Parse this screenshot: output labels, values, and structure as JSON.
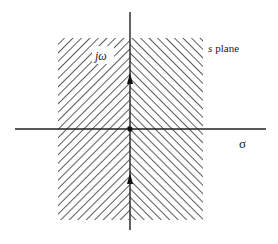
{
  "diagram": {
    "labels": {
      "imag_axis": "jω",
      "real_axis": "σ",
      "plane": "s plane"
    },
    "plane_var": "s",
    "plane_word": "plane",
    "region": {
      "description": "Entire strip hatched; left half with forward-slash hatching, right half with back-slash hatching (chevron pattern about the jω axis)",
      "x_range_px": [
        58,
        203
      ],
      "y_range_px": [
        38,
        220
      ]
    },
    "axes": {
      "vertical_x_px": 130,
      "vertical_y_range_px": [
        12,
        230
      ],
      "horizontal_y_px": 129,
      "horizontal_x_range_px": [
        15,
        266
      ]
    },
    "markers": [
      {
        "type": "origin-dot",
        "x": 130,
        "y": 129
      },
      {
        "type": "up-arrow",
        "x": 130,
        "y": 80
      },
      {
        "type": "up-arrow",
        "x": 130,
        "y": 180
      }
    ],
    "colors": {
      "line": "#222222",
      "hatch": "#333333",
      "background": "#ffffff"
    }
  }
}
